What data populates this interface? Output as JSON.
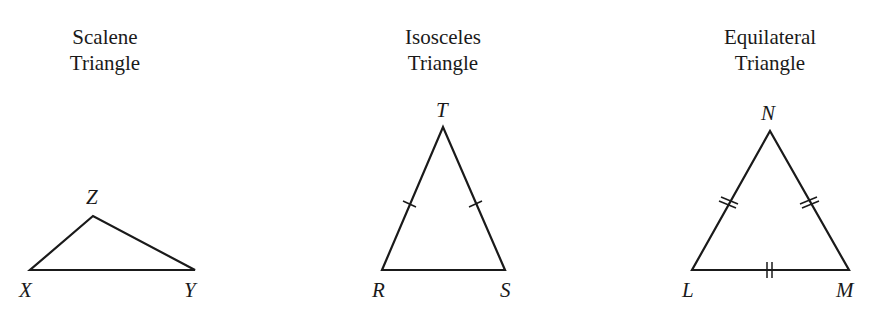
{
  "figures": [
    {
      "title_line1": "Scalene",
      "title_line2": "Triangle",
      "vertices": {
        "top": "Z",
        "left": "X",
        "right": "Y"
      },
      "tick_marks": "none"
    },
    {
      "title_line1": "Isosceles",
      "title_line2": "Triangle",
      "vertices": {
        "top": "T",
        "left": "R",
        "right": "S"
      },
      "tick_marks": "single ticks on TR and TS"
    },
    {
      "title_line1": "Equilateral",
      "title_line2": "Triangle",
      "vertices": {
        "top": "N",
        "left": "L",
        "right": "M"
      },
      "tick_marks": "double ticks on all three sides"
    }
  ],
  "colors": {
    "stroke": "#1a1a1a",
    "background": "#ffffff"
  }
}
